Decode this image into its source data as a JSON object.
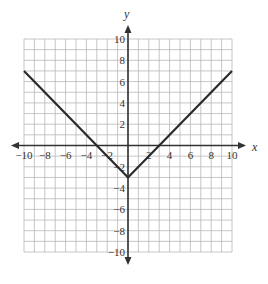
{
  "chart_data": {
    "type": "line",
    "title": "",
    "function": "y = |x| - 3",
    "xlabel": "x",
    "ylabel": "y",
    "xlim": [
      -10,
      10
    ],
    "ylim": [
      -10,
      10
    ],
    "grid": true,
    "grid_step": 1,
    "x_ticks": [
      -10,
      -8,
      -6,
      -4,
      -2,
      2,
      4,
      6,
      8,
      10
    ],
    "y_ticks": [
      10,
      8,
      6,
      4,
      2,
      -2,
      -4,
      -6,
      -8,
      -10
    ],
    "x_tick_labels": [
      "−10",
      "−8",
      "−6",
      "−4",
      "−2",
      "2",
      "4",
      "6",
      "8",
      "10"
    ],
    "y_tick_labels": [
      "10",
      "8",
      "6",
      "4",
      "2",
      "−2",
      "−4",
      "−6",
      "−8",
      "−10"
    ],
    "series": [
      {
        "name": "y = |x| - 3",
        "x": [
          -10,
          0,
          10
        ],
        "y": [
          7,
          -3,
          7
        ]
      }
    ],
    "key_points": {
      "vertex": [
        0,
        -3
      ],
      "x_intercepts": [
        [
          -3,
          0
        ],
        [
          3,
          0
        ]
      ],
      "y_intercept": [
        0,
        -3
      ]
    },
    "legend": null
  },
  "labels": {
    "x_axis": "x",
    "y_axis": "y"
  },
  "colors": {
    "grid": "#b8b8b8",
    "axis": "#333333",
    "line": "#2a2a2a",
    "background": "#ffffff"
  }
}
